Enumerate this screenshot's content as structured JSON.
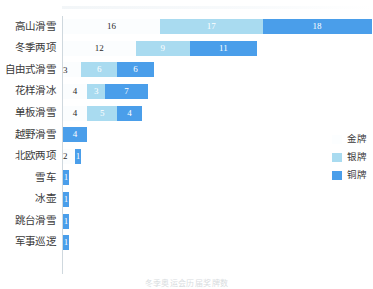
{
  "chart_data": {
    "type": "bar",
    "orientation": "horizontal",
    "stacked": true,
    "title": "",
    "xlabel": "",
    "ylabel": "",
    "grid": false,
    "legend_position": "right",
    "xlim": [
      0,
      51
    ],
    "categories": [
      "高山滑雪",
      "冬季两项",
      "自由式滑雪",
      "花样滑冰",
      "单板滑雪",
      "越野滑雪",
      "北欧两项",
      "雪车",
      "冰壶",
      "跳台滑雪",
      "军事巡逻"
    ],
    "series": [
      {
        "name": "金牌",
        "color": "#fbfdfe",
        "values": [
          16,
          12,
          3,
          4,
          4,
          0,
          2,
          0,
          0,
          0,
          0
        ]
      },
      {
        "name": "银牌",
        "color": "#a9dbf0",
        "values": [
          17,
          9,
          6,
          3,
          5,
          0,
          0,
          0,
          0,
          0,
          0
        ]
      },
      {
        "name": "铜牌",
        "color": "#4a9eea",
        "values": [
          18,
          11,
          6,
          7,
          4,
          4,
          1,
          1,
          1,
          1,
          1
        ]
      }
    ]
  },
  "legend": {
    "items": [
      {
        "label": "金牌",
        "color": "#fbfdfe"
      },
      {
        "label": "银牌",
        "color": "#a9dbf0"
      },
      {
        "label": "铜牌",
        "color": "#4a9eea"
      }
    ]
  },
  "caption": "冬季奥运会历届奖牌数"
}
